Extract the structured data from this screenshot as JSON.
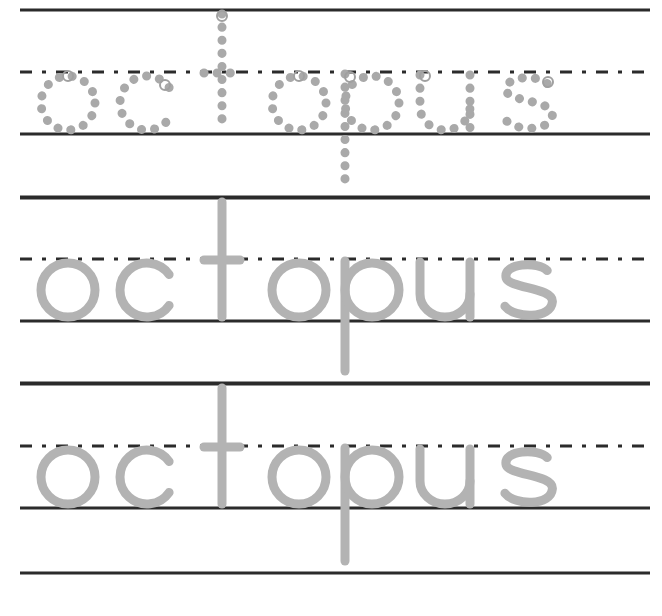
{
  "worksheet": {
    "word": "octopus",
    "colors": {
      "line": "#2b2b2b",
      "letter": "#b3b3b3",
      "dot": "#a9a9a9",
      "start_circle": "#a0a0a0",
      "background": "#ffffff"
    },
    "rows": [
      {
        "style": "dotted-trace",
        "word": "octopus",
        "top": 10,
        "mid": 72,
        "base": 134,
        "desc": 197
      },
      {
        "style": "solid-trace",
        "word": "octopus",
        "top": 198,
        "mid": 259,
        "base": 321,
        "desc": 383
      },
      {
        "style": "solid-trace",
        "word": "octopus",
        "top": 384,
        "mid": 446,
        "base": 508,
        "desc": 573
      }
    ],
    "letters": [
      {
        "char": "o",
        "cx": 68
      },
      {
        "char": "c",
        "cx": 147
      },
      {
        "char": "t",
        "cx": 222
      },
      {
        "char": "o",
        "cx": 299
      },
      {
        "char": "p",
        "cx": 372
      },
      {
        "char": "u",
        "cx": 445
      },
      {
        "char": "s",
        "cx": 528
      }
    ]
  }
}
